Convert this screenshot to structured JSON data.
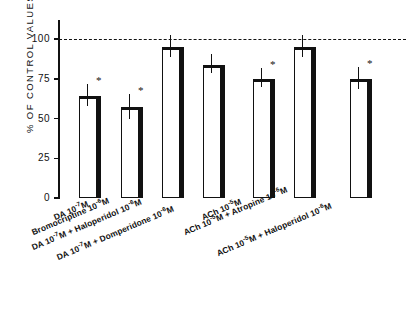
{
  "chart_data": {
    "type": "bar",
    "title": "",
    "xlabel": "",
    "ylabel": "% OF  CONTROL  VALUES",
    "ylim": [
      0,
      112
    ],
    "yticks": [
      0,
      25,
      50,
      75,
      100
    ],
    "ytick_labels": [
      "0",
      "25",
      "50",
      "75",
      "100"
    ],
    "grid": false,
    "legend": "none",
    "reference_line": {
      "value": 100,
      "style": "dashed",
      "label": "100"
    },
    "categories": [
      "DA  10⁻⁷M",
      "Bromocriptine  10⁻⁶M",
      "DA  10⁻⁷M  +  Haloperidol  10⁻⁶M",
      "DA  10⁻⁷M  +  Domperidone  10⁻⁶M",
      "ACh  10⁻⁵M",
      "ACh  10⁻⁵M  +  Atropine  10⁻⁶M",
      "ACh  10⁻⁵M  +  Haloperidol  10⁻⁶M"
    ],
    "values": [
      64,
      57,
      95,
      84,
      75,
      95,
      75
    ],
    "errors": [
      5,
      6,
      5,
      4,
      4,
      5,
      5
    ],
    "significance": [
      "*",
      "*",
      "",
      "",
      "*",
      "",
      "*"
    ],
    "bars": [
      {
        "label": "DA  10⁻⁷M",
        "value": 64,
        "error": 5,
        "star": "*"
      },
      {
        "label": "Bromocriptine  10⁻⁶M",
        "value": 57,
        "error": 6,
        "star": "*"
      },
      {
        "label": "DA  10⁻⁷M  +  Haloperidol  10⁻⁶M",
        "value": 95,
        "error": 5,
        "star": ""
      },
      {
        "label": "DA  10⁻⁷M  +  Domperidone  10⁻⁶M",
        "value": 84,
        "error": 4,
        "star": ""
      },
      {
        "label": "ACh  10⁻⁵M",
        "value": 75,
        "error": 4,
        "star": "*"
      },
      {
        "label": "ACh  10⁻⁵M  +  Atropine  10⁻⁶M",
        "value": 95,
        "error": 5,
        "star": ""
      },
      {
        "label": "ACh  10⁻⁵M  +  Haloperidol  10⁻⁶M",
        "value": 75,
        "error": 5,
        "star": "*"
      }
    ]
  },
  "x_labels_html": [
    "DA  10<sup>-7</sup>M",
    "Bromocriptine  10<sup>-6</sup>M",
    "DA  10<sup>-7</sup>M  +  Haloperidol  10<sup>-6</sup>M",
    "DA  10<sup>-7</sup>M  +  Domperidone  10<sup>-6</sup>M",
    "ACh  10<sup>-5</sup>M",
    "ACh  10<sup>-5</sup>M  +  Atropine  10<sup>-6</sup>M",
    "ACh  10<sup>-5</sup>M  +  Haloperidol  10<sup>-6</sup>M"
  ],
  "colors": {
    "ink": "#111111",
    "background": "#ffffff",
    "bar_fill": "#ffffff"
  }
}
